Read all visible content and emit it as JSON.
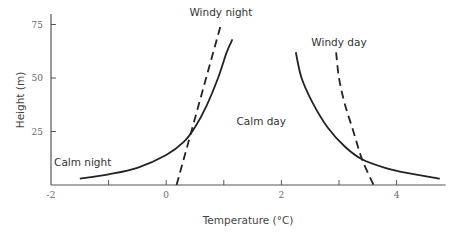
{
  "chart_data": {
    "type": "line",
    "title": "",
    "xlabel": "Temperature (°C)",
    "ylabel": "Height (m)",
    "xlim": [
      -2,
      4.85
    ],
    "ylim": [
      0,
      80
    ],
    "xticks": [
      -2,
      -1,
      0,
      1,
      2,
      3,
      4
    ],
    "xtick_labels": [
      "-2",
      "",
      "0",
      "",
      "2",
      "",
      "4"
    ],
    "yticks": [
      25,
      50,
      75
    ],
    "ytick_labels": [
      "25",
      "50",
      "75"
    ],
    "grid": false,
    "legend": "none (curves labeled directly)",
    "series": [
      {
        "name": "Calm night",
        "style": "solid",
        "points": [
          [
            -1.5,
            3
          ],
          [
            -1.0,
            5
          ],
          [
            -0.5,
            8
          ],
          [
            0.0,
            14
          ],
          [
            0.3,
            20
          ],
          [
            0.5,
            27
          ],
          [
            0.7,
            37
          ],
          [
            0.9,
            50
          ],
          [
            1.05,
            62
          ],
          [
            1.15,
            68
          ]
        ]
      },
      {
        "name": "Windy night",
        "style": "dashed",
        "points": [
          [
            0.18,
            0
          ],
          [
            0.95,
            75
          ]
        ]
      },
      {
        "name": "Calm day",
        "style": "solid",
        "points": [
          [
            2.25,
            62
          ],
          [
            2.35,
            50
          ],
          [
            2.55,
            38
          ],
          [
            2.8,
            27
          ],
          [
            3.1,
            18
          ],
          [
            3.4,
            12
          ],
          [
            3.8,
            8
          ],
          [
            4.2,
            5.5
          ],
          [
            4.75,
            3
          ]
        ]
      },
      {
        "name": "Windy day",
        "style": "dashed",
        "points": [
          [
            2.95,
            62
          ],
          [
            3.0,
            50
          ],
          [
            3.1,
            38
          ],
          [
            3.25,
            25
          ],
          [
            3.4,
            12
          ],
          [
            3.6,
            0
          ]
        ]
      }
    ],
    "annotations": [
      {
        "text": "Windy night",
        "at": [
          0.95,
          79
        ]
      },
      {
        "text": "Calm night",
        "at": [
          -1.45,
          9
        ]
      },
      {
        "text": "Windy day",
        "at": [
          3.0,
          65
        ]
      },
      {
        "text": "Calm day",
        "at": [
          1.65,
          28
        ]
      }
    ]
  }
}
